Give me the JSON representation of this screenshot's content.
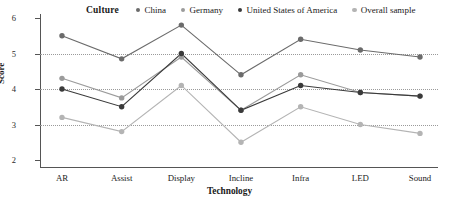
{
  "legend": {
    "title": "Culture",
    "entries": [
      {
        "label": "China",
        "color": "#6b6b6b"
      },
      {
        "label": "Germany",
        "color": "#9b9b9b"
      },
      {
        "label": "United States of America",
        "color": "#3a3a3a"
      },
      {
        "label": "Overall sample",
        "color": "#b4b4b4"
      }
    ]
  },
  "axes": {
    "ylabel": "Score",
    "xlabel": "Technology",
    "yticks": [
      "6",
      "5",
      "4",
      "3",
      "2"
    ],
    "gridline_values": [
      5,
      4,
      3
    ]
  },
  "chart_data": {
    "type": "line",
    "title": "Culture",
    "xlabel": "Technology",
    "ylabel": "Score",
    "categories": [
      "AR",
      "Assist",
      "Display",
      "Incline",
      "Infra",
      "LED",
      "Sound"
    ],
    "ylim": [
      1.6,
      6.2
    ],
    "yticks": [
      2,
      3,
      4,
      5,
      6
    ],
    "grid": "horizontal-dotted",
    "legend_position": "top",
    "series": [
      {
        "name": "China",
        "color": "#6b6b6b",
        "values": [
          5.5,
          4.85,
          5.8,
          4.4,
          5.4,
          5.1,
          4.9
        ]
      },
      {
        "name": "Germany",
        "color": "#9b9b9b",
        "values": [
          4.3,
          3.75,
          4.9,
          3.4,
          4.4,
          3.9,
          3.8
        ]
      },
      {
        "name": "United States of America",
        "color": "#3a3a3a",
        "values": [
          4.0,
          3.5,
          5.0,
          3.4,
          4.1,
          3.9,
          3.8
        ]
      },
      {
        "name": "Overall sample",
        "color": "#b4b4b4",
        "values": [
          3.2,
          2.8,
          4.1,
          2.5,
          3.5,
          3.0,
          2.75
        ]
      }
    ]
  }
}
